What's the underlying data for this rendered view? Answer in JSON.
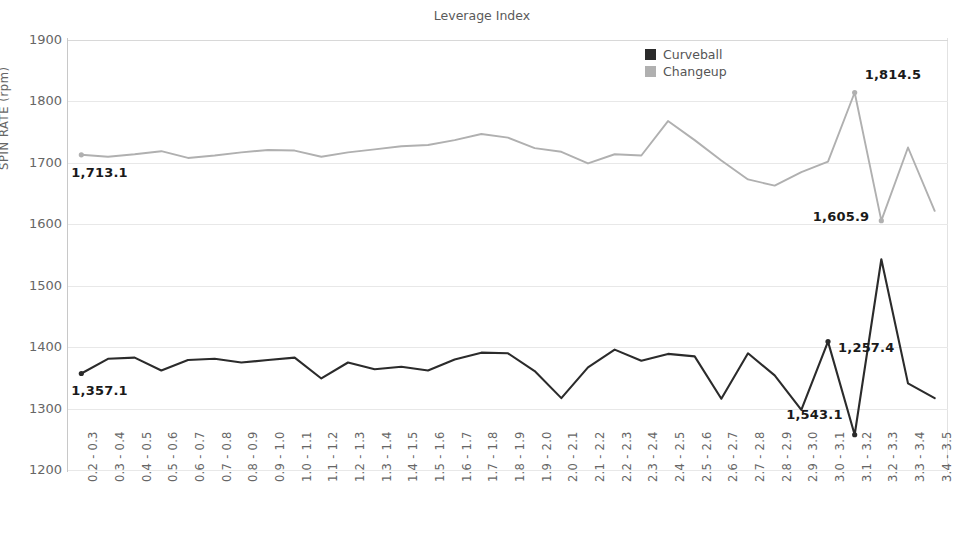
{
  "top_caption": "",
  "chart_title": "Leverage Index",
  "legend": {
    "position": "top-right",
    "items": [
      {
        "label": "Curveball",
        "color": "#2b2b2b"
      },
      {
        "label": "Changeup",
        "color": "#b0b0b0"
      }
    ]
  },
  "axes": {
    "ylabel": "SPIN RATE (rpm)",
    "xlabel": "",
    "yticks": [
      1900,
      1800,
      1700,
      1600,
      1500,
      1400,
      1300,
      1200
    ],
    "ylim": [
      1200,
      1900
    ]
  },
  "annotations": [
    {
      "text": "1,713.1",
      "series": "Changeup",
      "index": 0
    },
    {
      "text": "1,357.1",
      "series": "Curveball",
      "index": 0
    },
    {
      "text": "1,814.5",
      "series": "Changeup",
      "index": 29
    },
    {
      "text": "1,605.9",
      "series": "Changeup",
      "index": 30
    },
    {
      "text": "1,543.1",
      "series": "Curveball",
      "index": 29
    },
    {
      "text": "1,257.4",
      "series": "Curveball",
      "index": 28
    }
  ],
  "chart_data": {
    "type": "line",
    "title": "Leverage Index",
    "xlabel": "",
    "ylabel": "SPIN RATE (rpm)",
    "ylim": [
      1200,
      1900
    ],
    "grid": true,
    "legend_position": "top-right",
    "categories": [
      "0.2 - 0.3",
      "0.3 - 0.4",
      "0.4 - 0.5",
      "0.5 - 0.6",
      "0.6 - 0.7",
      "0.7 - 0.8",
      "0.8 - 0.9",
      "0.9 - 1.0",
      "1.0 - 1.1",
      "1.1 - 1.2",
      "1.2 - 1.3",
      "1.3 - 1.4",
      "1.4 - 1.5",
      "1.5 - 1.6",
      "1.6 - 1.7",
      "1.7 - 1.8",
      "1.8 - 1.9",
      "1.9 - 2.0",
      "2.0 - 2.1",
      "2.1 - 2.2",
      "2.2 - 2.3",
      "2.3 - 2.4",
      "2.4 - 2.5",
      "2.5 - 2.6",
      "2.6 - 2.7",
      "2.7 - 2.8",
      "2.8 - 2.9",
      "2.9 - 3.0",
      "3.0 - 3.1",
      "3.1 - 3.2",
      "3.2 - 3.3",
      "3.3 - 3.4",
      "3.4 - 3.5"
    ],
    "series": [
      {
        "name": "Curveball",
        "color": "#2b2b2b",
        "values": [
          1357.1,
          1381.0,
          1383.0,
          1362.0,
          1379.0,
          1381.0,
          1375.0,
          1379.0,
          1383.0,
          1349.0,
          1375.0,
          1364.0,
          1368.0,
          1362.0,
          1380.0,
          1391.0,
          1390.0,
          1361.0,
          1317.0,
          1367.0,
          1396.0,
          1378.0,
          1389.0,
          1385.0,
          1316.0,
          1390.0,
          1354.0,
          1298.0,
          1409.0,
          1257.4,
          1543.1,
          1341.0,
          1317.0
        ]
      },
      {
        "name": "Changeup",
        "color": "#b0b0b0",
        "values": [
          1713.1,
          1710.0,
          1714.0,
          1719.0,
          1708.0,
          1712.0,
          1717.0,
          1721.0,
          1720.0,
          1710.0,
          1717.0,
          1722.0,
          1727.0,
          1729.0,
          1737.0,
          1747.0,
          1741.0,
          1724.0,
          1718.0,
          1699.0,
          1714.0,
          1712.0,
          1768.0,
          1737.0,
          1704.0,
          1673.0,
          1663.0,
          1685.0,
          1702.0,
          1814.5,
          1605.9,
          1725.0,
          1622.0
        ]
      }
    ]
  }
}
